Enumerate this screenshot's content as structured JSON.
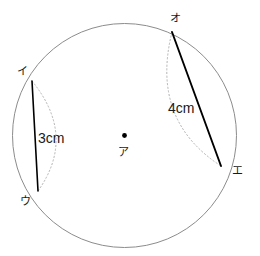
{
  "figure": {
    "type": "geometry-diagram",
    "canvas": {
      "width": 260,
      "height": 256,
      "background": "#ffffff"
    },
    "colors": {
      "circle_stroke": "#8c8c8c",
      "chord_stroke": "#000000",
      "arc_stroke": "#b4b4b4",
      "center_dot": "#000000",
      "text": "#1a1a1a"
    },
    "circle": {
      "name": "main-circle",
      "center_x": 124.5,
      "center_y": 135.5,
      "radius": 112
    },
    "center_point": {
      "label": "ア",
      "x": 124.5,
      "y": 135.5,
      "label_x": 118,
      "label_y": 147
    },
    "points": [
      {
        "id": "i",
        "label": "イ",
        "x": 32,
        "y": 81,
        "label_x": 17,
        "label_y": 66
      },
      {
        "id": "u",
        "label": "ウ",
        "x": 38,
        "y": 191,
        "label_x": 20,
        "label_y": 196
      },
      {
        "id": "o",
        "label": "オ",
        "x": 172,
        "y": 32,
        "label_x": 170,
        "label_y": 13
      },
      {
        "id": "e",
        "label": "エ",
        "x": 221,
        "y": 166,
        "label_x": 232,
        "label_y": 165
      }
    ],
    "chords": [
      {
        "id": "chord-i-u",
        "name": "chord-i-u",
        "from": "イ",
        "to": "ウ",
        "length_label": "3cm",
        "label_x": 38,
        "label_y": 131,
        "arc_bulge_x": 77,
        "arc_bulge_y": 136
      },
      {
        "id": "chord-o-e",
        "name": "chord-o-e",
        "from": "オ",
        "to": "エ",
        "length_label": "4cm",
        "label_x": 168,
        "label_y": 101,
        "arc_bulge_x": 150,
        "arc_bulge_y": 120
      }
    ]
  }
}
